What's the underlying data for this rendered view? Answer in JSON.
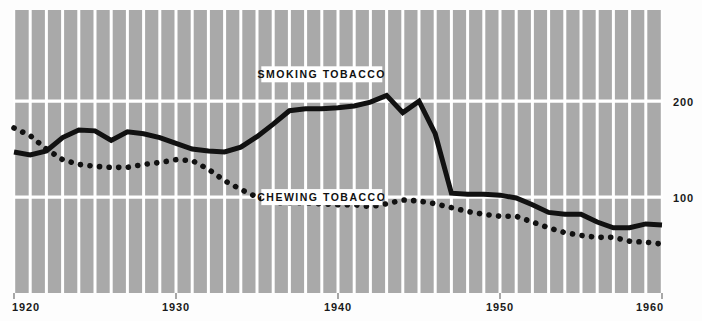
{
  "chart_data": {
    "type": "line",
    "title": "",
    "xlabel": "",
    "ylabel": "",
    "xlim": [
      1920,
      1960
    ],
    "ylim": [
      0,
      295
    ],
    "grid": true,
    "grid_orientation": "both",
    "gridline_spacing_years": 1,
    "legend_position": "inline-labels",
    "y_ticks": [
      100,
      200
    ],
    "y_tick_labels": [
      "100",
      "200"
    ],
    "y_tick_side": "right",
    "x_ticks": [
      1920,
      1930,
      1940,
      1950,
      1960
    ],
    "x_tick_labels": [
      "1920",
      "1930",
      "1940",
      "1950",
      "1960"
    ],
    "x": [
      1920,
      1921,
      1922,
      1923,
      1924,
      1925,
      1926,
      1927,
      1928,
      1929,
      1930,
      1931,
      1932,
      1933,
      1934,
      1935,
      1936,
      1937,
      1938,
      1939,
      1940,
      1941,
      1942,
      1943,
      1944,
      1945,
      1946,
      1947,
      1948,
      1949,
      1950,
      1951,
      1952,
      1953,
      1954,
      1955,
      1956,
      1957,
      1958,
      1959,
      1960
    ],
    "series": [
      {
        "name": "SMOKING TOBACCO",
        "style": "solid",
        "color": "#111111",
        "line_width": 5,
        "label_box": true,
        "values": [
          147,
          144,
          148,
          162,
          170,
          169,
          159,
          168,
          166,
          162,
          156,
          150,
          148,
          147,
          152,
          163,
          176,
          190,
          192,
          192,
          193,
          195,
          199,
          206,
          188,
          200,
          166,
          104,
          103,
          103,
          102,
          99,
          92,
          84,
          82,
          82,
          74,
          68,
          68,
          72,
          71
        ]
      },
      {
        "name": "CHEWING TOBACCO",
        "style": "dotted",
        "color": "#111111",
        "line_width": 5,
        "label_box": true,
        "values": [
          172,
          164,
          150,
          139,
          134,
          132,
          131,
          131,
          134,
          136,
          139,
          138,
          129,
          117,
          108,
          100,
          94,
          94,
          94,
          93,
          92,
          92,
          90,
          93,
          97,
          96,
          93,
          89,
          85,
          82,
          80,
          80,
          74,
          68,
          63,
          60,
          58,
          58,
          54,
          53,
          51
        ]
      }
    ],
    "annotations": [
      {
        "text": "SMOKING TOBACCO",
        "x": 1939,
        "y": 228
      },
      {
        "text": "CHEWING TOBACCO",
        "x": 1939,
        "y": 100
      }
    ]
  },
  "colors": {
    "plot_background": "#a9a9a9",
    "gridline": "#ffffff",
    "series_line": "#111111",
    "page_background": "#fdfdfd",
    "tick_text": "#1a1a1a",
    "label_box_fill": "#ffffff"
  }
}
